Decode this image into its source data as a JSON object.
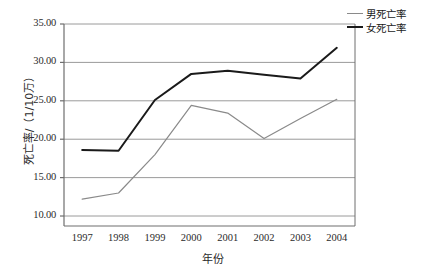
{
  "chart_data": {
    "type": "line",
    "title": "",
    "xlabel": "年份",
    "ylabel": "死亡率/（1/10万）",
    "categories": [
      "1997",
      "1998",
      "1999",
      "2000",
      "2001",
      "2002",
      "2003",
      "2004"
    ],
    "x": [
      1997,
      1998,
      1999,
      2000,
      2001,
      2002,
      2003,
      2004
    ],
    "series": [
      {
        "name": "男死亡率",
        "color": "#8a8a8a",
        "width": 1.2,
        "values": [
          12.2,
          13.0,
          18.0,
          24.4,
          23.4,
          20.1,
          22.7,
          25.2
        ]
      },
      {
        "name": "女死亡率",
        "color": "#1a1a1a",
        "width": 2.0,
        "values": [
          18.6,
          18.5,
          25.1,
          28.5,
          28.9,
          28.4,
          27.9,
          31.9
        ]
      }
    ],
    "ylim": [
      8.7,
      35.0
    ],
    "yticks": [
      10.0,
      15.0,
      20.0,
      25.0,
      30.0,
      35.0
    ],
    "ytick_labels": [
      "10.00",
      "15.00",
      "20.00",
      "25.00",
      "30.00",
      "35.00"
    ],
    "grid": true,
    "grid_axis": "y",
    "legend_position": "top-right",
    "legend_entries": [
      "男死亡率",
      "女死亡率"
    ],
    "axis_color": "#6e6e6e",
    "grid_color": "#9a9a9a"
  }
}
